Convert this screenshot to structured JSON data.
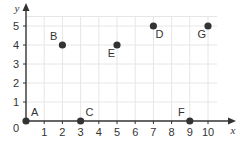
{
  "chart_data": {
    "type": "scatter",
    "title": "",
    "xlabel": "x",
    "ylabel": "y",
    "xlim": [
      0,
      10.5
    ],
    "ylim": [
      0,
      5.5
    ],
    "grid": true,
    "origin_label": "0",
    "x_ticks": [
      1,
      2,
      3,
      4,
      5,
      6,
      7,
      8,
      9,
      10
    ],
    "y_ticks": [
      1,
      2,
      3,
      4,
      5
    ],
    "points": [
      {
        "label": "A",
        "x": 0,
        "y": 0,
        "label_pos": "above-right"
      },
      {
        "label": "B",
        "x": 2,
        "y": 4,
        "label_pos": "above-left"
      },
      {
        "label": "C",
        "x": 3,
        "y": 0,
        "label_pos": "above-right"
      },
      {
        "label": "D",
        "x": 7,
        "y": 5,
        "label_pos": "below-right"
      },
      {
        "label": "E",
        "x": 5,
        "y": 4,
        "label_pos": "below-left"
      },
      {
        "label": "F",
        "x": 9,
        "y": 0,
        "label_pos": "above-left"
      },
      {
        "label": "G",
        "x": 10,
        "y": 5,
        "label_pos": "below-left"
      }
    ],
    "colors": {
      "point": "#333333",
      "axis": "#333333",
      "grid": "#e6e6e6",
      "text": "#333333"
    }
  }
}
